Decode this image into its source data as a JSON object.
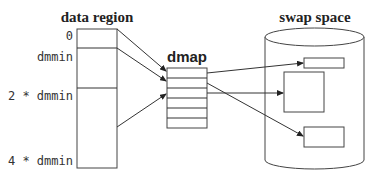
{
  "diagram": {
    "data_region": {
      "title": "data region",
      "labels": [
        "0",
        "dmmin",
        "2 * dmmin",
        "4 * dmmin"
      ]
    },
    "dmap": {
      "title": "dmap",
      "rows": 6
    },
    "swap_space": {
      "title": "swap space",
      "blocks": 3
    },
    "colors": {
      "stroke": "#333333",
      "background": "#ffffff"
    }
  }
}
